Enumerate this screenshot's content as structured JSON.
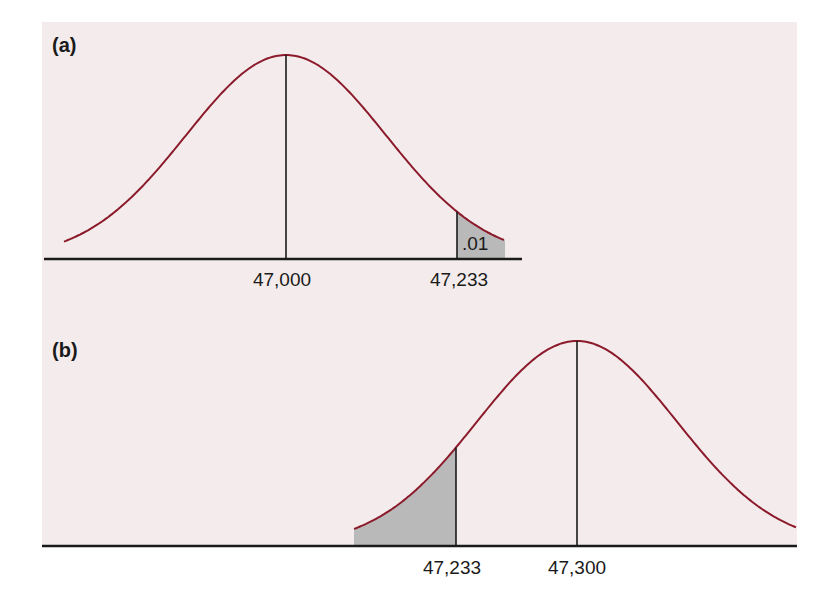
{
  "chart_data": [
    {
      "type": "area",
      "panel": "(a)",
      "title": "",
      "distribution": "normal",
      "mean": 47000,
      "xlabel": "",
      "ylabel": "",
      "grid": false,
      "tick_labels": [
        "47,000",
        "47,233"
      ],
      "ticks": [
        47000,
        47233
      ],
      "shaded_region": {
        "from": 47233,
        "to": "right tail",
        "label": ".01"
      },
      "colors": {
        "curve": "#8b1a2b",
        "shade": "#b9b9b9",
        "axis": "#1a1a1a"
      }
    },
    {
      "type": "area",
      "panel": "(b)",
      "title": "",
      "distribution": "normal",
      "mean": 47300,
      "xlabel": "",
      "ylabel": "",
      "grid": false,
      "tick_labels": [
        "47,233",
        "47,300"
      ],
      "ticks": [
        47233,
        47300
      ],
      "shaded_region": {
        "from": "left tail",
        "to": 47233,
        "label": ""
      },
      "colors": {
        "curve": "#8b1a2b",
        "shade": "#b9b9b9",
        "axis": "#1a1a1a"
      }
    }
  ],
  "figure": {
    "panel_a": {
      "label": "(a)",
      "area_label": ".01",
      "mean_label": "47,000",
      "cutoff_label": "47,233"
    },
    "panel_b": {
      "label": "(b)",
      "cutoff_label": "47,233",
      "mean_label": "47,300"
    }
  }
}
